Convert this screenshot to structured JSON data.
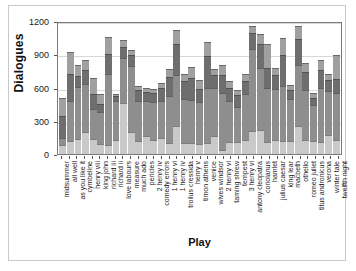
{
  "chart_data": {
    "type": "bar",
    "subtype": "stacked",
    "title": "",
    "xlabel": "Play",
    "ylabel": "Dialogues",
    "ylim": [
      0,
      1200
    ],
    "yticks": [
      0,
      300,
      600,
      900,
      1200
    ],
    "ytick_labels": [
      "0",
      "300",
      "600",
      "900",
      "1200"
    ],
    "grid": true,
    "legend": "none",
    "orientation": "vertical",
    "segment_colors": [
      "#c9c9c9",
      "#8e8e8e",
      "#6e6e6e",
      "#a0a0a0",
      "#585858",
      "#7c7c7c",
      "#9a9a9a"
    ],
    "categories": [
      "midsummer",
      "all well",
      "as you like it",
      "cymbeline",
      "henry viii",
      "king john",
      "richard iii",
      "richard ii",
      "love labours",
      "measure",
      "much ado",
      "pericles",
      "2 henry iv",
      "comedy errors",
      "1 henry vi",
      "1 henry iv",
      "troilus cressida",
      "henry v",
      "timon athens",
      "venice",
      "wives windsor",
      "2 henry vi",
      "taming shrew",
      "tempest",
      "3 henry vi",
      "antony cleopatra",
      "coriolanus",
      "hamlet",
      "julius caesar",
      "king lear",
      "macbeth",
      "othello",
      "romeo juliet",
      "titus andronicus",
      "verona",
      "winter tale",
      "twelfth night"
    ],
    "totals": [
      505,
      920,
      800,
      845,
      690,
      545,
      1055,
      540,
      1030,
      935,
      615,
      600,
      590,
      645,
      765,
      1120,
      725,
      785,
      665,
      1010,
      770,
      805,
      660,
      580,
      725,
      1155,
      1085,
      995,
      780,
      1050,
      620,
      1155,
      820,
      550,
      845,
      720,
      890
    ],
    "stacks": [
      [
        85,
        60,
        200,
        160
      ],
      [
        120,
        360,
        240,
        200
      ],
      [
        135,
        470,
        100,
        95
      ],
      [
        200,
        430,
        125,
        90
      ],
      [
        135,
        275,
        130,
        150
      ],
      [
        90,
        285,
        75,
        95
      ],
      [
        85,
        640,
        180,
        150
      ],
      [
        130,
        350,
        45,
        15
      ],
      [
        460,
        410,
        95,
        65
      ],
      [
        200,
        590,
        100,
        45
      ],
      [
        120,
        360,
        95,
        40
      ],
      [
        160,
        320,
        80,
        40
      ],
      [
        130,
        340,
        85,
        35
      ],
      [
        140,
        340,
        120,
        45
      ],
      [
        95,
        430,
        170,
        70
      ],
      [
        250,
        465,
        280,
        125
      ],
      [
        100,
        395,
        160,
        70
      ],
      [
        95,
        390,
        200,
        100
      ],
      [
        90,
        380,
        120,
        75
      ],
      [
        95,
        500,
        290,
        125
      ],
      [
        160,
        440,
        115,
        55
      ],
      [
        40,
        510,
        165,
        90
      ],
      [
        110,
        370,
        120,
        60
      ],
      [
        105,
        320,
        105,
        50
      ],
      [
        130,
        410,
        120,
        65
      ],
      [
        210,
        740,
        145,
        60
      ],
      [
        220,
        560,
        215,
        90
      ],
      [
        105,
        490,
        185,
        215
      ],
      [
        125,
        465,
        125,
        65
      ],
      [
        115,
        500,
        280,
        155
      ],
      [
        120,
        375,
        80,
        45
      ],
      [
        250,
        555,
        230,
        120
      ],
      [
        130,
        450,
        160,
        80
      ],
      [
        120,
        320,
        70,
        40
      ],
      [
        110,
        490,
        160,
        85
      ],
      [
        175,
        390,
        105,
        50
      ],
      [
        130,
        425,
        120,
        215
      ]
    ]
  }
}
